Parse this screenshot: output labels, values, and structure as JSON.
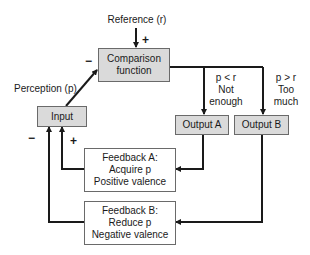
{
  "diagram": {
    "reference_label": "Reference (r)",
    "perception_label": "Perception (p)",
    "comparison": {
      "line1": "Comparison",
      "line2": "function"
    },
    "input": {
      "label": "Input"
    },
    "output_a": {
      "label": "Output A"
    },
    "output_b": {
      "label": "Output B"
    },
    "condition_a": {
      "line1": "p < r",
      "line2": "Not",
      "line3": "enough"
    },
    "condition_b": {
      "line1": "p > r",
      "line2": "Too",
      "line3": "much"
    },
    "feedback_a": {
      "line1": "Feedback A:",
      "line2": "Acquire p",
      "line3": "Positive valence"
    },
    "feedback_b": {
      "line1": "Feedback B:",
      "line2": "Reduce p",
      "line3": "Negative valence"
    },
    "signs": {
      "reference_plus": "+",
      "perception_minus": "−",
      "feedback_b_minus": "−",
      "feedback_a_plus": "+"
    },
    "colors": {
      "box_fill": "#dadada",
      "line": "#1a1a1a",
      "border": "#6a6a6a"
    }
  }
}
